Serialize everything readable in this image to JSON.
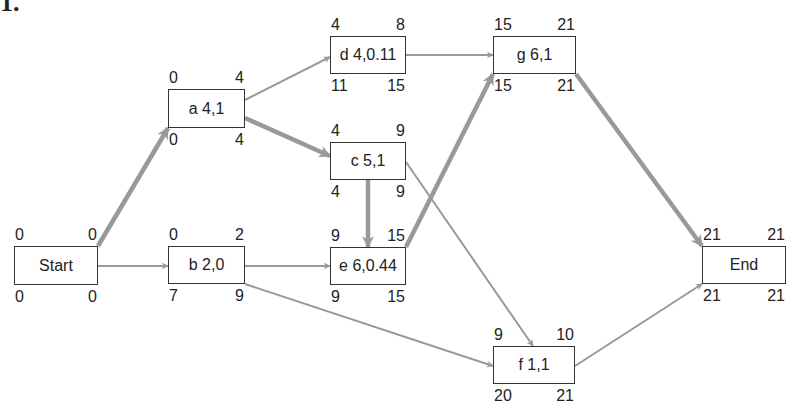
{
  "problem_number": "1.",
  "colors": {
    "edge": "#999999",
    "critical_edge": "#999999",
    "box_border": "#333333",
    "text": "#222222"
  },
  "nodes": [
    {
      "id": "start",
      "label": "Start",
      "es": "0",
      "ef": "0",
      "ls": "0",
      "lf": "0",
      "box": [
        14,
        246,
        84,
        39
      ]
    },
    {
      "id": "a",
      "label": "a 4,1",
      "es": "0",
      "ef": "4",
      "ls": "0",
      "lf": "4",
      "box": [
        168,
        89,
        77,
        39
      ]
    },
    {
      "id": "b",
      "label": "b 2,0",
      "es": "0",
      "ef": "2",
      "ls": "7",
      "lf": "9",
      "box": [
        168,
        246,
        77,
        38
      ]
    },
    {
      "id": "c",
      "label": "c 5,1",
      "es": "4",
      "ef": "9",
      "ls": "4",
      "lf": "9",
      "box": [
        330,
        142,
        76,
        38
      ]
    },
    {
      "id": "d",
      "label": "d 4,0.11",
      "es": "4",
      "ef": "8",
      "ls": "11",
      "lf": "15",
      "box": [
        330,
        36,
        76,
        38
      ]
    },
    {
      "id": "e",
      "label": "e 6,0.44",
      "es": "9",
      "ef": "15",
      "ls": "9",
      "lf": "15",
      "box": [
        330,
        247,
        76,
        38
      ]
    },
    {
      "id": "f",
      "label": "f 1,1",
      "es": "9",
      "ef": "10",
      "ls": "20",
      "lf": "21",
      "box": [
        493,
        346,
        82,
        38
      ]
    },
    {
      "id": "g",
      "label": "g 6,1",
      "es": "15",
      "ef": "21",
      "ls": "15",
      "lf": "21",
      "box": [
        493,
        36,
        83,
        38
      ]
    },
    {
      "id": "end",
      "label": "End",
      "es": "21",
      "ef": "21",
      "ls": "21",
      "lf": "21",
      "box": [
        702,
        246,
        84,
        38
      ]
    }
  ],
  "edges": [
    {
      "from": "start",
      "to": "a",
      "critical": true,
      "pts": [
        98,
        246,
        168,
        128
      ]
    },
    {
      "from": "start",
      "to": "b",
      "critical": false,
      "pts": [
        98,
        266,
        168,
        266
      ]
    },
    {
      "from": "a",
      "to": "d",
      "critical": false,
      "pts": [
        245,
        100,
        330,
        57
      ]
    },
    {
      "from": "a",
      "to": "c",
      "critical": true,
      "pts": [
        245,
        118,
        330,
        156
      ]
    },
    {
      "from": "b",
      "to": "e",
      "critical": false,
      "pts": [
        245,
        266,
        330,
        266
      ]
    },
    {
      "from": "b",
      "to": "f",
      "critical": false,
      "pts": [
        245,
        284,
        493,
        366
      ]
    },
    {
      "from": "c",
      "to": "e",
      "critical": true,
      "pts": [
        368,
        180,
        368,
        247
      ]
    },
    {
      "from": "c",
      "to": "f",
      "critical": false,
      "pts": [
        406,
        162,
        533,
        346
      ]
    },
    {
      "from": "d",
      "to": "g",
      "critical": false,
      "pts": [
        406,
        55,
        493,
        55
      ]
    },
    {
      "from": "e",
      "to": "g",
      "critical": true,
      "pts": [
        406,
        247,
        493,
        74
      ]
    },
    {
      "from": "g",
      "to": "end",
      "critical": true,
      "pts": [
        576,
        74,
        702,
        246
      ]
    },
    {
      "from": "f",
      "to": "end",
      "critical": false,
      "pts": [
        575,
        366,
        702,
        284
      ]
    }
  ]
}
